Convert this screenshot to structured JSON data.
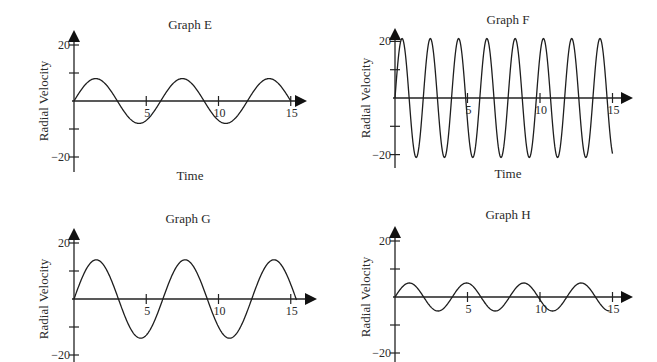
{
  "chart_data": [
    {
      "type": "line",
      "title": "Graph E",
      "xlabel": "Time",
      "ylabel": "Radial Velocity",
      "xticks": [
        5,
        10,
        15
      ],
      "yticks": [
        20,
        10,
        0,
        -10,
        -20
      ],
      "ytick_labels": [
        "20",
        "",
        "",
        "",
        "−20"
      ],
      "xlim": [
        0,
        15
      ],
      "ylim": [
        -20,
        20
      ],
      "grid": false,
      "series": [
        {
          "name": "radial velocity",
          "function": "sine",
          "amplitude": 8,
          "period": 6.0,
          "phase": 0,
          "x_start": 0,
          "x_end": 15
        }
      ],
      "layout": {
        "origin_x": 74,
        "origin_y": 101,
        "px_per_x": 14.45,
        "px_per_y": 2.8,
        "axis_top": 30,
        "axis_bottom": 172,
        "axis_right": 307,
        "title_x": 190,
        "title_y": 29,
        "xlabel_y": 180,
        "ylabel_x": 48
      }
    },
    {
      "type": "line",
      "title": "Graph F",
      "xlabel": "Time",
      "ylabel": "Radial Velocity",
      "xticks": [
        5,
        10,
        15
      ],
      "yticks": [
        20,
        10,
        0,
        -10,
        -20
      ],
      "ytick_labels": [
        "20",
        "",
        "",
        "",
        "−20"
      ],
      "xlim": [
        0,
        15
      ],
      "ylim": [
        -20,
        20
      ],
      "grid": false,
      "series": [
        {
          "name": "radial velocity",
          "function": "sine",
          "amplitude": 21,
          "period": 1.95,
          "phase": 0,
          "x_start": 0,
          "x_end": 15
        }
      ],
      "layout": {
        "origin_x": 395,
        "origin_y": 98,
        "px_per_x": 14.5,
        "px_per_y": 2.83,
        "axis_top": 28,
        "axis_bottom": 168,
        "axis_right": 633,
        "title_x": 508,
        "title_y": 24,
        "xlabel_y": 178,
        "ylabel_x": 370
      }
    },
    {
      "type": "line",
      "title": "Graph G",
      "xlabel": "",
      "ylabel": "Radial Velocity",
      "xticks": [
        5,
        10,
        15
      ],
      "yticks": [
        20,
        10,
        0,
        -10,
        -20
      ],
      "ytick_labels": [
        "20",
        "",
        "",
        "",
        "−20"
      ],
      "xlim": [
        0,
        15
      ],
      "ylim": [
        -20,
        20
      ],
      "grid": false,
      "series": [
        {
          "name": "radial velocity",
          "function": "sine",
          "amplitude": 14,
          "period": 6.15,
          "phase": 0,
          "x_start": 0,
          "x_end": 15.4
        }
      ],
      "layout": {
        "origin_x": 74,
        "origin_y": 299,
        "px_per_x": 14.45,
        "px_per_y": 2.8,
        "axis_top": 228,
        "axis_bottom": 362,
        "axis_right": 317,
        "title_x": 188,
        "title_y": 223,
        "xlabel_y": 0,
        "ylabel_x": 48
      }
    },
    {
      "type": "line",
      "title": "Graph H",
      "xlabel": "",
      "ylabel": "Radial Velocity",
      "xticks": [
        5,
        10,
        15
      ],
      "yticks": [
        20,
        10,
        0,
        -10,
        -20
      ],
      "ytick_labels": [
        "20",
        "",
        "",
        "",
        "−20"
      ],
      "xlim": [
        0,
        15
      ],
      "ylim": [
        -20,
        20
      ],
      "grid": false,
      "series": [
        {
          "name": "radial velocity",
          "function": "sine",
          "amplitude": 5,
          "period": 3.95,
          "phase": 0,
          "x_start": 0,
          "x_end": 14.8
        }
      ],
      "layout": {
        "origin_x": 395,
        "origin_y": 297,
        "px_per_x": 14.5,
        "px_per_y": 2.8,
        "axis_top": 226,
        "axis_bottom": 362,
        "axis_right": 633,
        "title_x": 508,
        "title_y": 219,
        "xlabel_y": 0,
        "ylabel_x": 370
      }
    }
  ],
  "graphs": [
    {
      "title": "Graph E",
      "xlabel": "Time",
      "ylabel": "Radial Velocity",
      "y_top_label": "20",
      "y_bottom_label": "−20",
      "x_labels": [
        "5",
        "10",
        "15"
      ]
    },
    {
      "title": "Graph F",
      "xlabel": "Time",
      "ylabel": "Radial Velocity",
      "y_top_label": "20",
      "y_bottom_label": "−20",
      "x_labels": [
        "5",
        "10",
        "15"
      ]
    },
    {
      "title": "Graph G",
      "xlabel": "",
      "ylabel": "Radial Velocity",
      "y_top_label": "20",
      "y_bottom_label": "−20",
      "x_labels": [
        "5",
        "10",
        "15"
      ]
    },
    {
      "title": "Graph H",
      "xlabel": "",
      "ylabel": "Radial Velocity",
      "y_top_label": "20",
      "y_bottom_label": "−20",
      "x_labels": [
        "5",
        "10",
        "15"
      ]
    }
  ]
}
